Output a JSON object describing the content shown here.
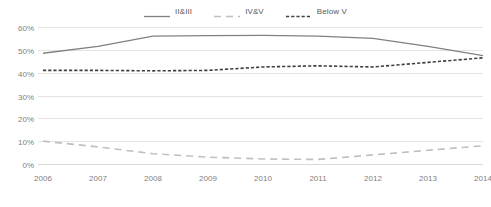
{
  "chart_data": {
    "type": "line",
    "title": "",
    "subtitle": "",
    "xlabel": "",
    "ylabel": "",
    "x": [
      2006,
      2007,
      2008,
      2009,
      2010,
      2011,
      2012,
      2013,
      2014
    ],
    "categories": [
      "2006",
      "2007",
      "2008",
      "2009",
      "2010",
      "2011",
      "2012",
      "2013",
      "2014"
    ],
    "ylim": [
      0,
      60
    ],
    "ytick_values": [
      0,
      10,
      20,
      30,
      40,
      50,
      60
    ],
    "ytick_labels": [
      "0%",
      "10%",
      "20%",
      "30%",
      "40%",
      "50%",
      "60%"
    ],
    "grid": true,
    "legend_position": "top-center",
    "series": [
      {
        "name": "II&III",
        "style": "solid",
        "color": "#808080",
        "values": [
          48.5,
          51.5,
          56.0,
          56.2,
          56.3,
          56.0,
          55.0,
          51.5,
          47.5
        ]
      },
      {
        "name": "IV&V",
        "style": "dashed",
        "color": "#bfbfbf",
        "values": [
          10.0,
          7.5,
          4.5,
          3.0,
          2.2,
          2.0,
          4.0,
          6.0,
          8.0
        ]
      },
      {
        "name": "Below V",
        "style": "dotted-dash",
        "color": "#404040",
        "values": [
          41.0,
          41.0,
          40.8,
          41.0,
          42.5,
          43.0,
          42.5,
          44.5,
          46.5
        ]
      }
    ]
  },
  "legend": {
    "entries": [
      {
        "label": "II&III"
      },
      {
        "label": "IV&V"
      },
      {
        "label": "Below V"
      }
    ]
  },
  "axes": {
    "y": {
      "labels": [
        "60%",
        "50%",
        "40%",
        "30%",
        "20%",
        "10%",
        "0%"
      ]
    },
    "x": {
      "labels": [
        "2006",
        "2007",
        "2008",
        "2009",
        "2010",
        "2011",
        "2012",
        "2013",
        "2014"
      ]
    }
  },
  "colors": {
    "series_solid": "#808080",
    "series_light_dashed": "#bfbfbf",
    "series_dark_dashed": "#404040",
    "gridline": "#e4e4e4",
    "tick_text": "#7f7f7f",
    "legend_text": "#595959",
    "background": "#ffffff"
  }
}
